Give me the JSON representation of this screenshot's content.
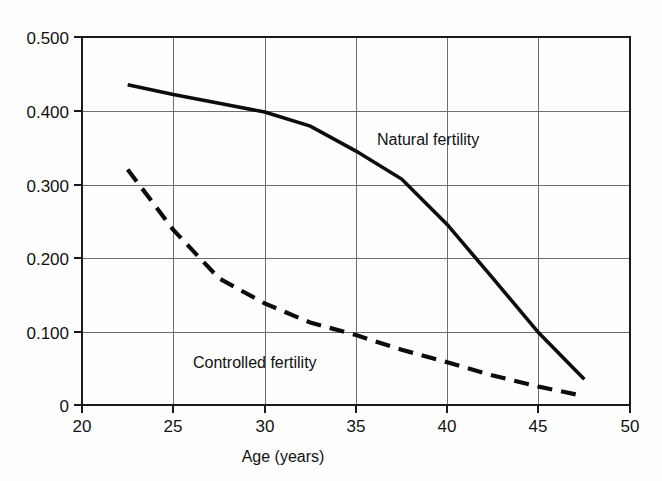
{
  "chart_data": {
    "type": "line",
    "title": "",
    "xlabel": "Age (years)",
    "ylabel": "",
    "xlim": [
      20,
      50
    ],
    "ylim": [
      0,
      0.5
    ],
    "grid": true,
    "legend_position": "inline-annotation",
    "x_ticks": [
      "20",
      "25",
      "30",
      "35",
      "40",
      "45",
      "50"
    ],
    "x_tick_values": [
      20,
      25,
      30,
      35,
      40,
      45,
      50
    ],
    "y_ticks": [
      "0",
      "0.100",
      "0.200",
      "0.300",
      "0.400",
      "0.500"
    ],
    "y_tick_values": [
      0,
      0.1,
      0.2,
      0.3,
      0.4,
      0.5
    ],
    "series": [
      {
        "name": "Natural fertility",
        "style": "solid",
        "color": "#0c0c0c",
        "x": [
          22.5,
          25.0,
          27.5,
          30.0,
          32.5,
          35.0,
          37.5,
          40.0,
          42.5,
          45.0,
          47.5
        ],
        "values": [
          0.435,
          0.422,
          0.41,
          0.398,
          0.379,
          0.345,
          0.307,
          0.245,
          0.172,
          0.098,
          0.035
        ],
        "label_text": "Natural fertility",
        "label_x": 36.2,
        "label_y": 0.345
      },
      {
        "name": "Controlled fertility",
        "style": "dashed",
        "color": "#0c0c0c",
        "x": [
          22.5,
          25.0,
          27.5,
          30.0,
          32.5,
          35.0,
          37.5,
          40.0,
          42.5,
          45.0,
          47.5
        ],
        "values": [
          0.32,
          0.238,
          0.172,
          0.138,
          0.112,
          0.095,
          0.075,
          0.058,
          0.04,
          0.025,
          0.012
        ],
        "label_text": "Controlled fertility",
        "label_x": 28.9,
        "label_y": 0.063
      }
    ],
    "annotations": [
      {
        "text": "Natural fertility",
        "x": 36.2,
        "y": 0.345
      },
      {
        "text": "Controlled fertility",
        "x": 28.9,
        "y": 0.063
      }
    ],
    "colors": {
      "background": "#fefefe",
      "frame": "#1a1a1a",
      "grid": "#6e6e6e",
      "curve": "#0c0c0c"
    }
  },
  "axis": {
    "x_title": "Age (years)",
    "y_title": ""
  }
}
